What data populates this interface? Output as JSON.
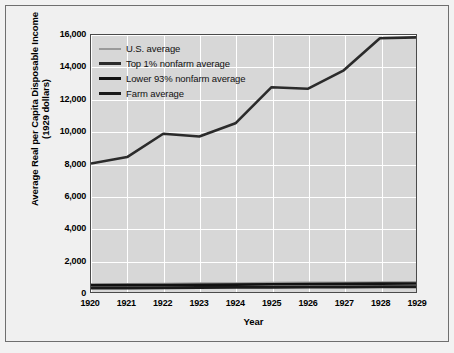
{
  "chart_data": {
    "type": "line",
    "title": "",
    "xlabel": "Year",
    "ylabel": "Average Real per Capita Disposable Income (1929 dollars)",
    "ylabel_line1": "Average Real per Capita Disposable Income",
    "ylabel_line2": "(1929 dollars)",
    "x": [
      1920,
      1921,
      1922,
      1923,
      1924,
      1925,
      1926,
      1927,
      1928,
      1929
    ],
    "xtick_labels": [
      "1920",
      "1921",
      "1922",
      "1923",
      "1924",
      "1925",
      "1926",
      "1927",
      "1928",
      "1929"
    ],
    "ytick_labels": [
      "0",
      "2,000",
      "4,000",
      "6,000",
      "8,000",
      "10,000",
      "12,000",
      "14,000",
      "16,000"
    ],
    "ytick_values": [
      0,
      2000,
      4000,
      6000,
      8000,
      10000,
      12000,
      14000,
      16000
    ],
    "xlim": [
      1920,
      1929
    ],
    "ylim": [
      0,
      16000
    ],
    "grid": true,
    "legend_position": "top-left",
    "series": [
      {
        "name": "U.S. average",
        "color": "#9a9a9a",
        "width": 2.0,
        "values": [
          500,
          505,
          520,
          545,
          545,
          575,
          590,
          595,
          610,
          620
        ]
      },
      {
        "name": "Top 1% nonfarm average",
        "color": "#2b2b2b",
        "width": 2.6,
        "values": [
          8000,
          8400,
          9850,
          9680,
          10500,
          12750,
          12650,
          13800,
          15800,
          15850
        ]
      },
      {
        "name": "Lower 93% nonfarm average",
        "color": "#111111",
        "width": 2.6,
        "values": [
          420,
          425,
          440,
          455,
          460,
          485,
          495,
          505,
          520,
          530
        ]
      },
      {
        "name": "Farm average",
        "color": "#1a1a1a",
        "width": 3.0,
        "values": [
          250,
          245,
          270,
          285,
          290,
          300,
          305,
          310,
          320,
          325
        ]
      }
    ]
  },
  "figure": {
    "background_color": "#f0f0f0",
    "plot_background_color": "#d7d7d7",
    "grid_color": "#ffffff",
    "border_color": "#4a4a4a"
  }
}
